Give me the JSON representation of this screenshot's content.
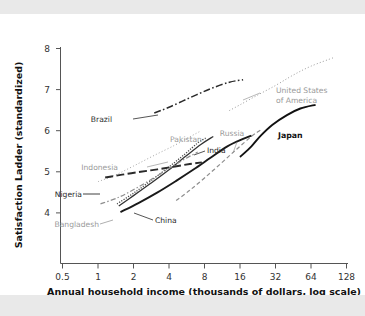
{
  "page": {
    "background_color": "#e9e9e9",
    "card_color": "#ffffff"
  },
  "chart_data": {
    "type": "line",
    "title": "",
    "subtitle": "",
    "xlabel": "Annual household income (thousands of dollars, log scale)",
    "ylabel": "Satisfaction Ladder (standardized)",
    "x_scale": "log2",
    "x_tick_labels": [
      "0.5",
      "1",
      "2",
      "4",
      "8",
      "16",
      "32",
      "64",
      "128"
    ],
    "x_tick_values": [
      0.5,
      1,
      2,
      4,
      8,
      16,
      32,
      64,
      128
    ],
    "xlim": [
      0.5,
      128
    ],
    "y_tick_labels": [
      "4",
      "5",
      "6",
      "7",
      "8"
    ],
    "y_tick_values": [
      4,
      5,
      6,
      7,
      8
    ],
    "ylim": [
      3.45,
      8.15
    ],
    "grid": false,
    "legend": "inline-annotations",
    "legend_position": "inline",
    "series": [
      {
        "name": "United States of America",
        "label": "United States of America",
        "label_lines": [
          "United States",
          "of America"
        ],
        "style": "dotted",
        "color": "#9a9a9a",
        "label_color": "#9a9a9a",
        "points": [
          {
            "x": 13,
            "y": 6.49
          },
          {
            "x": 16,
            "y": 6.63
          },
          {
            "x": 22,
            "y": 6.85
          },
          {
            "x": 32,
            "y": 7.1
          },
          {
            "x": 45,
            "y": 7.35
          },
          {
            "x": 64,
            "y": 7.57
          },
          {
            "x": 100,
            "y": 7.78
          }
        ]
      },
      {
        "name": "Brazil",
        "label": "Brazil",
        "style": "dash-dot",
        "color": "#2a2a2a",
        "label_color": "#2a2a2a",
        "points": [
          {
            "x": 3.0,
            "y": 6.43
          },
          {
            "x": 4.0,
            "y": 6.57
          },
          {
            "x": 6.0,
            "y": 6.8
          },
          {
            "x": 9.0,
            "y": 7.02
          },
          {
            "x": 13.0,
            "y": 7.18
          },
          {
            "x": 17.0,
            "y": 7.24
          }
        ]
      },
      {
        "name": "Japan",
        "label": "Japan",
        "style": "solid-thick",
        "color": "#111111",
        "label_color": "#111111",
        "points": [
          {
            "x": 16.0,
            "y": 5.36
          },
          {
            "x": 20.0,
            "y": 5.62
          },
          {
            "x": 24.0,
            "y": 5.88
          },
          {
            "x": 30.0,
            "y": 6.14
          },
          {
            "x": 40.0,
            "y": 6.38
          },
          {
            "x": 52.0,
            "y": 6.54
          },
          {
            "x": 70.0,
            "y": 6.63
          }
        ]
      },
      {
        "name": "Russia",
        "label": "Russia",
        "style": "dashed",
        "color": "#8e8e8e",
        "label_color": "#9a9a9a",
        "points": [
          {
            "x": 4.6,
            "y": 4.3
          },
          {
            "x": 6.0,
            "y": 4.55
          },
          {
            "x": 8.0,
            "y": 4.85
          },
          {
            "x": 11.0,
            "y": 5.2
          },
          {
            "x": 15.0,
            "y": 5.55
          },
          {
            "x": 20.0,
            "y": 5.86
          },
          {
            "x": 24.0,
            "y": 6.02
          }
        ]
      },
      {
        "name": "India",
        "label": "India",
        "style": "solid",
        "color": "#333333",
        "label_color": "#2a2a2a",
        "points": [
          {
            "x": 1.5,
            "y": 4.17
          },
          {
            "x": 2.0,
            "y": 4.42
          },
          {
            "x": 2.8,
            "y": 4.72
          },
          {
            "x": 4.0,
            "y": 5.05
          },
          {
            "x": 5.5,
            "y": 5.37
          },
          {
            "x": 7.5,
            "y": 5.67
          },
          {
            "x": 9.5,
            "y": 5.86
          }
        ]
      },
      {
        "name": "Pakistan",
        "label": "Pakistan",
        "style": "dotted-dense",
        "color": "#4a4a4a",
        "label_color": "#9a9a9a",
        "points": [
          {
            "x": 1.45,
            "y": 4.22
          },
          {
            "x": 2.0,
            "y": 4.48
          },
          {
            "x": 2.8,
            "y": 4.78
          },
          {
            "x": 4.0,
            "y": 5.12
          },
          {
            "x": 5.5,
            "y": 5.44
          },
          {
            "x": 7.0,
            "y": 5.7
          },
          {
            "x": 8.2,
            "y": 5.82
          }
        ]
      },
      {
        "name": "Indonesia",
        "label": "Indonesia",
        "style": "dotted",
        "color": "#a5a5a5",
        "label_color": "#9a9a9a",
        "points": [
          {
            "x": 1.0,
            "y": 4.76
          },
          {
            "x": 1.4,
            "y": 4.92
          },
          {
            "x": 2.0,
            "y": 5.14
          },
          {
            "x": 3.0,
            "y": 5.4
          },
          {
            "x": 4.5,
            "y": 5.65
          },
          {
            "x": 6.0,
            "y": 5.85
          },
          {
            "x": 7.5,
            "y": 6.0
          }
        ]
      },
      {
        "name": "Nigeria",
        "label": "Nigeria",
        "style": "long-dash",
        "color": "#2a2a2a",
        "label_color": "#2a2a2a",
        "points": [
          {
            "x": 1.15,
            "y": 4.86
          },
          {
            "x": 1.6,
            "y": 4.93
          },
          {
            "x": 2.3,
            "y": 5.0
          },
          {
            "x": 3.2,
            "y": 5.06
          },
          {
            "x": 4.5,
            "y": 5.13
          },
          {
            "x": 6.0,
            "y": 5.19
          },
          {
            "x": 7.6,
            "y": 5.23
          }
        ]
      },
      {
        "name": "Bangladesh",
        "label": "Bangladesh",
        "style": "dash-dot-gray",
        "color": "#8e8e8e",
        "label_color": "#9a9a9a",
        "points": [
          {
            "x": 1.05,
            "y": 4.22
          },
          {
            "x": 1.5,
            "y": 4.38
          },
          {
            "x": 2.1,
            "y": 4.6
          },
          {
            "x": 3.0,
            "y": 4.86
          },
          {
            "x": 4.2,
            "y": 5.12
          },
          {
            "x": 5.6,
            "y": 5.33
          },
          {
            "x": 7.0,
            "y": 5.48
          }
        ]
      },
      {
        "name": "China",
        "label": "China",
        "style": "solid-thick",
        "color": "#1a1a1a",
        "label_color": "#2a2a2a",
        "points": [
          {
            "x": 1.55,
            "y": 4.02
          },
          {
            "x": 2.2,
            "y": 4.24
          },
          {
            "x": 3.2,
            "y": 4.5
          },
          {
            "x": 4.6,
            "y": 4.78
          },
          {
            "x": 6.5,
            "y": 5.06
          },
          {
            "x": 9.0,
            "y": 5.34
          },
          {
            "x": 12.5,
            "y": 5.62
          },
          {
            "x": 17.0,
            "y": 5.8
          },
          {
            "x": 20.0,
            "y": 5.88
          }
        ]
      }
    ],
    "annotations": [
      {
        "text": "Brazil",
        "x_px": 112,
        "y_px": 108
      },
      {
        "text": "United States",
        "x_px": 276,
        "y_px": 79
      },
      {
        "text": "of America",
        "x_px": 276,
        "y_px": 89
      },
      {
        "text": "Indonesia",
        "x_px": 118,
        "y_px": 156
      },
      {
        "text": "Pakistan",
        "x_px": 186,
        "y_px": 128
      },
      {
        "text": "India",
        "x_px": 207,
        "y_px": 139
      },
      {
        "text": "Russia",
        "x_px": 232,
        "y_px": 122
      },
      {
        "text": "Japan",
        "x_px": 278,
        "y_px": 124
      },
      {
        "text": "Nigeria",
        "x_px": 60,
        "y_px": 183
      },
      {
        "text": "Bangladesh",
        "x_px": 58,
        "y_px": 213
      },
      {
        "text": "China",
        "x_px": 155,
        "y_px": 209
      }
    ]
  }
}
